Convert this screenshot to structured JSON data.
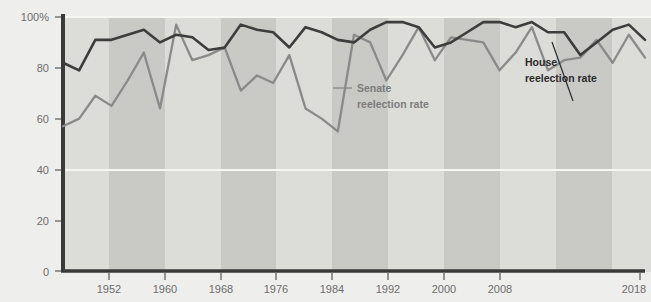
{
  "chart_data": {
    "type": "line",
    "title": "",
    "subtitle": "",
    "xlabel": "",
    "ylabel": "",
    "xlim": [
      1946,
      2018
    ],
    "ylim": [
      0,
      100
    ],
    "grid": false,
    "legend_position": "inline-annotations",
    "y_ticks": [
      "0",
      "20",
      "40",
      "60",
      "80",
      "100%"
    ],
    "y_tick_values": [
      0,
      20,
      40,
      60,
      80,
      100
    ],
    "x_ticks": [
      "1952",
      "1960",
      "1968",
      "1976",
      "1984",
      "1992",
      "2000",
      "2008",
      "2018"
    ],
    "x_tick_values": [
      1952,
      1960,
      1968,
      1976,
      1984,
      1992,
      2000,
      2008,
      2018
    ],
    "x": [
      1946,
      1948,
      1950,
      1952,
      1954,
      1956,
      1958,
      1960,
      1962,
      1964,
      1966,
      1968,
      1970,
      1972,
      1974,
      1976,
      1978,
      1980,
      1982,
      1984,
      1986,
      1988,
      1990,
      1992,
      1994,
      1996,
      1998,
      2000,
      2002,
      2004,
      2006,
      2008,
      2010,
      2012,
      2014,
      2016,
      2018
    ],
    "series": [
      {
        "name": "House reelection rate",
        "color": "#3d3d3d",
        "values": [
          82,
          79,
          91,
          91,
          93,
          95,
          90,
          93,
          92,
          87,
          88,
          97,
          95,
          94,
          88,
          96,
          94,
          91,
          90,
          95,
          98,
          98,
          96,
          88,
          90,
          94,
          98,
          98,
          96,
          98,
          94,
          94,
          85,
          90,
          95,
          97,
          91
        ]
      },
      {
        "name": "Senate reelection rate",
        "color": "#8a8a8a",
        "values": [
          57,
          60,
          69,
          65,
          75,
          86,
          64,
          97,
          83,
          85,
          88,
          71,
          77,
          74,
          85,
          64,
          60,
          55,
          93,
          90,
          75,
          85,
          96,
          83,
          92,
          91,
          90,
          79,
          86,
          96,
          79,
          83,
          84,
          91,
          82,
          93,
          84
        ]
      }
    ],
    "annotations": [
      {
        "label_line1": "Senate",
        "label_line2": "reelection rate",
        "style": "light"
      },
      {
        "label_line1": "House",
        "label_line2": "reelection rate",
        "style": "dark"
      }
    ]
  },
  "annotations": {
    "senate": {
      "line1": "Senate",
      "line2": "reelection rate"
    },
    "house": {
      "line1": "House",
      "line2": "reelection rate"
    }
  },
  "colors": {
    "background": "#eeeeec",
    "band_light": "#dcdcd8",
    "band_dark": "#c9c9c6",
    "axis": "#3a3a3a",
    "house_line": "#3d3d3d",
    "senate_line": "#8a8a8a",
    "tick_text": "#6d6d6d",
    "gridline": "#f3f3f0"
  }
}
